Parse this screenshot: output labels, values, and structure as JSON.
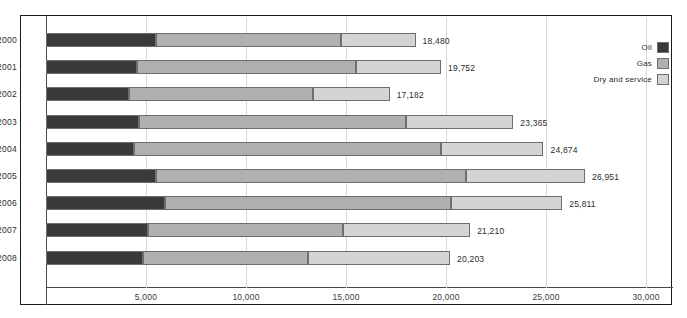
{
  "chart_data": {
    "type": "bar",
    "orientation": "horizontal",
    "stacked": true,
    "title": "",
    "xlabel": "",
    "ylabel": "",
    "xlim": [
      0,
      30000
    ],
    "grid": true,
    "legend_position": "top-right",
    "categories": [
      "2000",
      "2001",
      "2002",
      "2003",
      "2004",
      "2005",
      "2006",
      "2007",
      "2008"
    ],
    "xticks": [
      5000,
      10000,
      15000,
      20000,
      25000,
      30000
    ],
    "xtick_labels": [
      "5,000",
      "10,000",
      "15,000",
      "20,000",
      "25,000",
      "30,000"
    ],
    "series": [
      {
        "name": "Oil",
        "color": "#3a3a3a",
        "values": [
          5500,
          4550,
          4150,
          4650,
          4400,
          5500,
          5950,
          5100,
          4850
        ]
      },
      {
        "name": "Gas",
        "color": "#b0b0b0",
        "values": [
          9250,
          10950,
          9200,
          13350,
          15350,
          15500,
          14300,
          9750,
          8250
        ]
      },
      {
        "name": "Dry and service",
        "color": "#d4d4d4",
        "values": [
          3730,
          4252,
          3832,
          5365,
          5124,
          5951,
          5561,
          6360,
          7103
        ]
      }
    ],
    "totals": [
      18480,
      19752,
      17182,
      23365,
      24874,
      26951,
      25811,
      21210,
      20203
    ],
    "total_labels": [
      "18,480",
      "19,752",
      "17,182",
      "23,365",
      "24,874",
      "26,951",
      "25,811",
      "21,210",
      "20,203"
    ]
  },
  "legend": {
    "items": [
      {
        "label": "Oil",
        "color": "#3a3a3a"
      },
      {
        "label": "Gas",
        "color": "#b0b0b0"
      },
      {
        "label": "Dry and service",
        "color": "#d4d4d4"
      }
    ]
  }
}
